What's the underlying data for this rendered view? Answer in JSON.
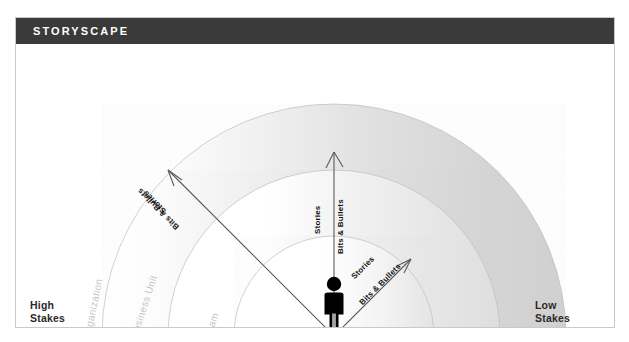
{
  "header": {
    "title": "STORYSCAPE",
    "bar_color": "#3a3a3a",
    "text_color": "#ffffff"
  },
  "panel": {
    "border_color": "#c9c9c9",
    "background": "#ffffff"
  },
  "diagram": {
    "type": "concentric-semicircle-zones",
    "center_label": "person-figure",
    "figure_color": "#000000",
    "gradient": {
      "from": "#ffffff",
      "to": "#cccccc",
      "direction": "left-to-right"
    },
    "rings": [
      {
        "id": "team",
        "label": "Team",
        "radius": 100,
        "color": "#c6c6c6"
      },
      {
        "id": "business-unit",
        "label": "Business Unit",
        "radius": 166,
        "color": "#c6c6c6"
      },
      {
        "id": "organization",
        "label": "Organization",
        "radius": 232,
        "color": "#c6c6c6"
      }
    ],
    "arrows": [
      {
        "id": "arrow-inner",
        "angle_deg": -45,
        "labels": {
          "upper": "Stories",
          "lower": "Bits & Bullets"
        }
      },
      {
        "id": "arrow-middle",
        "angle_deg": -90,
        "labels": {
          "upper": "Stories",
          "lower": "Bits & Bullets"
        }
      },
      {
        "id": "arrow-outer",
        "angle_deg": -135,
        "labels": {
          "upper": "Stories",
          "lower": "Bits & Bullets"
        }
      }
    ],
    "axis_labels": {
      "left": "High\nStakes",
      "right": "Low\nStakes"
    }
  }
}
